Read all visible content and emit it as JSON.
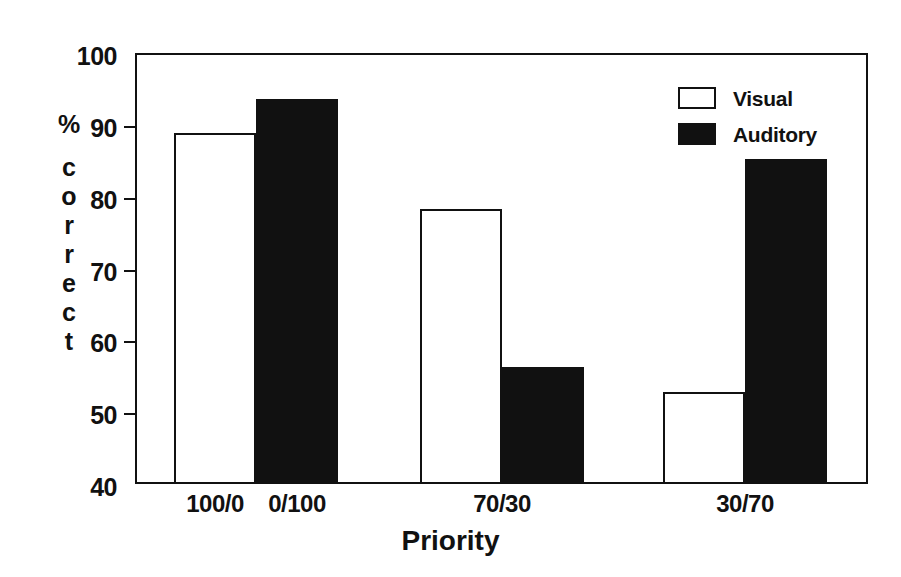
{
  "chart_data": {
    "type": "bar",
    "title": "",
    "subtitle": "",
    "xlabel": "Priority",
    "ylabel": "% correct",
    "categories": [
      "100/0",
      "0/100",
      "70/30",
      "30/70"
    ],
    "series": [
      {
        "name": "Visual",
        "values": [
          88.6,
          null,
          78.0,
          52.5
        ]
      },
      {
        "name": "Auditory",
        "values": [
          null,
          93.3,
          56.0,
          85.0
        ]
      }
    ],
    "bars": [
      {
        "group": "100/0",
        "series": "Visual",
        "value": 88.6
      },
      {
        "group": "0/100",
        "series": "Auditory",
        "value": 93.3
      },
      {
        "group": "70/30",
        "series": "Visual",
        "value": 78.0
      },
      {
        "group": "70/30",
        "series": "Auditory",
        "value": 56.0
      },
      {
        "group": "30/70",
        "series": "Visual",
        "value": 52.5
      },
      {
        "group": "30/70",
        "series": "Auditory",
        "value": 85.0
      }
    ],
    "ylim": [
      40,
      100
    ],
    "yticks": [
      40,
      50,
      60,
      70,
      80,
      90,
      100
    ],
    "ytick_labels": [
      "40",
      "50",
      "60",
      "70",
      "80",
      "90",
      "100"
    ],
    "xtick_labels": [
      "100/0",
      "0/100",
      "70/30",
      "30/70"
    ],
    "grid": false,
    "legend": {
      "position": "top-right",
      "entries": [
        {
          "label": "Visual",
          "swatch": "outlined-white-box",
          "color": "#ffffff"
        },
        {
          "label": "Auditory",
          "swatch": "filled-black-box",
          "color": "#111111"
        }
      ]
    },
    "colors": {
      "visual": "#ffffff",
      "auditory": "#111111",
      "axis": "#111111",
      "background": "#ffffff"
    }
  },
  "axis": {
    "y_title_glyphs": [
      "%",
      "c",
      "o",
      "r",
      "r",
      "e",
      "c",
      "t"
    ],
    "x_title": "Priority"
  }
}
